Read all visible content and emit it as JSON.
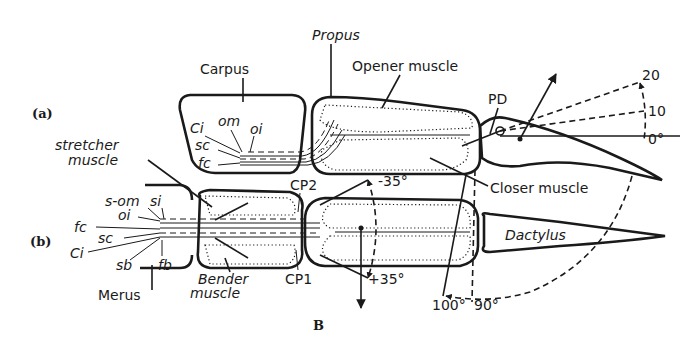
{
  "figure": {
    "panel_a_label": "(a)",
    "panel_b_label": "(b)",
    "caption_letter": "B",
    "labels": {
      "carpus": "Carpus",
      "propus": "Propus",
      "opener_muscle": "Opener muscle",
      "closer_muscle": "Closer muscle",
      "stretcher_muscle_line1": "stretcher",
      "stretcher_muscle_line2": "muscle",
      "bender_muscle_line1": "Bender",
      "bender_muscle_line2": "muscle",
      "dactylus": "Dactylus",
      "merus": "Merus",
      "pd": "PD",
      "cp1": "CP1",
      "cp2": "CP2",
      "ci_a": "Ci",
      "om": "om",
      "oi_a": "oi",
      "sc_a": "sc",
      "fc_a": "fc",
      "s_om": "s-om",
      "si": "si",
      "oi_b": "oi",
      "fc_b": "fc",
      "sc_b": "sc",
      "ci_b": "Ci",
      "sb": "sb",
      "fb": "fb"
    },
    "angles": {
      "deg_20": "20",
      "deg_10": "10",
      "deg_0": "0°",
      "minus_35": "-35°",
      "plus_35": "+35°",
      "deg_100": "100°",
      "deg_90": "90°"
    }
  }
}
